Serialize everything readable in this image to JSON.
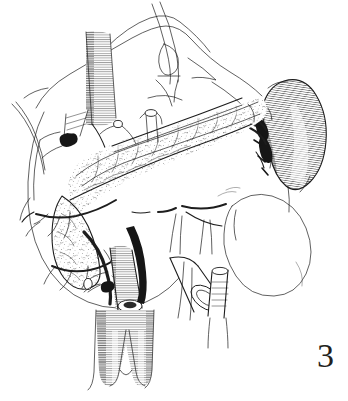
{
  "figure": {
    "number_label": "3",
    "caption": "",
    "background_color": "#ffffff",
    "ink_color": "#1d1d1d",
    "width": 348,
    "height": 401,
    "medium": "pen-and-ink line drawing with stipple and hatching"
  },
  "structures": [
    {
      "id": "stomach",
      "label": "stomach (retracted)",
      "render_style": "outline"
    },
    {
      "id": "retractor",
      "label": "retractor loop",
      "render_style": "outline"
    },
    {
      "id": "inferior-vena-cava",
      "label": "inferior vena cava",
      "render_style": "hatched-tube"
    },
    {
      "id": "aorta",
      "label": "abdominal aorta with bifurcation",
      "render_style": "hatched-tube"
    },
    {
      "id": "pancreas",
      "label": "pancreas body and tail",
      "render_style": "stippled-lobulated"
    },
    {
      "id": "spleen",
      "label": "spleen",
      "render_style": "cross-hatched"
    },
    {
      "id": "splenic-hilum",
      "label": "splenic hilum vessels",
      "render_style": "dense-black"
    },
    {
      "id": "left-kidney",
      "label": "left kidney",
      "render_style": "outline"
    },
    {
      "id": "splenic-vein",
      "label": "splenic vein",
      "render_style": "tube"
    },
    {
      "id": "superior-mesenteric-vessels",
      "label": "superior mesenteric vessels",
      "render_style": "tube"
    },
    {
      "id": "transected-vessel-stump-left",
      "label": "transected vessel stump",
      "render_style": "open-lumen"
    },
    {
      "id": "transected-vessel-stump-right",
      "label": "transected vessel stump",
      "render_style": "open-lumen"
    },
    {
      "id": "vascular-clip",
      "label": "vascular clip / ligature",
      "render_style": "solid-black"
    },
    {
      "id": "mesenteric-branches",
      "label": "mesenteric arterial branches",
      "render_style": "fine-branching"
    },
    {
      "id": "duodenum",
      "label": "duodenal sweep",
      "render_style": "outline"
    }
  ]
}
